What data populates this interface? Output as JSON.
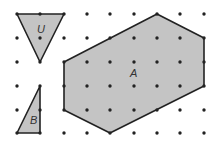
{
  "diagram": {
    "title": "Dot grid with shapes U, B and A",
    "grid": {
      "xs": [
        17,
        40,
        64,
        87,
        110,
        134,
        157,
        180,
        204
      ],
      "ys": [
        14,
        38,
        62,
        86,
        110,
        133
      ],
      "dot_color": "#222222"
    },
    "shape_fill": "#c4c4c4",
    "stroke_color": "#222222",
    "shapes": [
      {
        "label": "U",
        "points": "17,14 64,14 40,62",
        "label_x": 37,
        "label_y": 33
      },
      {
        "label": "B",
        "points": "17,133 40,86 40,133",
        "label_x": 30,
        "label_y": 124
      },
      {
        "label": "A",
        "points": "157,14 204,38 204,86 110,133 64,110 64,62",
        "label_x": 130,
        "label_y": 77
      }
    ]
  }
}
